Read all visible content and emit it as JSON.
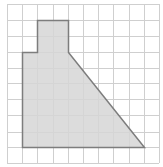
{
  "figure": {
    "type": "grid-polygon",
    "grid": {
      "columns": 10,
      "rows": 10,
      "x_lines": [
        7,
        22,
        37,
        53,
        68,
        83,
        98,
        113,
        129,
        144,
        159
      ],
      "y_lines": [
        4,
        20,
        36,
        52,
        68,
        83,
        99,
        115,
        132,
        147,
        163
      ],
      "line_color": "#cfcfcf"
    },
    "polygon": {
      "vertices_grid": [
        [
          1,
          3
        ],
        [
          2,
          3
        ],
        [
          2,
          1
        ],
        [
          4,
          1
        ],
        [
          4,
          3
        ],
        [
          9,
          9
        ],
        [
          1,
          9
        ]
      ],
      "fill_color": "#d6d6d6",
      "stroke_color": "#7d7d7d"
    }
  }
}
